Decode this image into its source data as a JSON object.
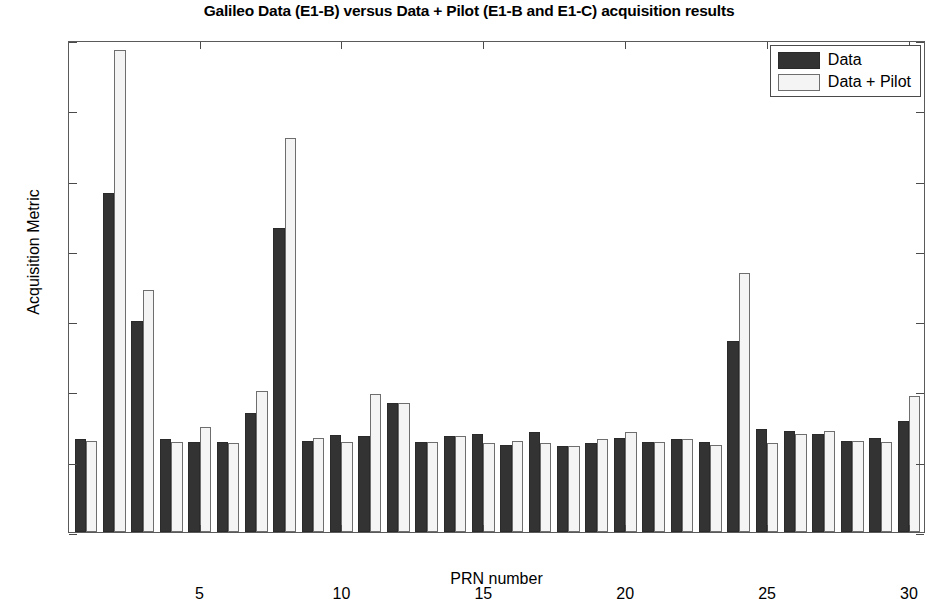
{
  "chart_data": {
    "type": "bar",
    "title": "Galileo Data (E1-B) versus Data + Pilot (E1-B and E1-C) acquisition results",
    "xlabel": "PRN number",
    "ylabel": "Acquisition Metric",
    "ylim": [
      0,
      35
    ],
    "xlim": [
      0.4,
      30.6
    ],
    "ytick_values": [
      0,
      5,
      10,
      15,
      20,
      25,
      30,
      35
    ],
    "ytick_labels": [
      "0",
      "5",
      "10",
      "15",
      "20",
      "25",
      "30",
      "35"
    ],
    "xtick_values": [
      5,
      10,
      15,
      20,
      25,
      30
    ],
    "xtick_labels": [
      "5",
      "10",
      "15",
      "20",
      "25",
      "30"
    ],
    "grid": false,
    "legend_position": "top-right",
    "categories": [
      1,
      2,
      3,
      4,
      5,
      6,
      7,
      8,
      9,
      10,
      11,
      12,
      13,
      14,
      15,
      16,
      17,
      18,
      19,
      20,
      21,
      22,
      23,
      24,
      25,
      26,
      27,
      28,
      29,
      30
    ],
    "series": [
      {
        "name": "Data",
        "color": "#333333",
        "values": [
          6.6,
          24.1,
          15.0,
          6.6,
          6.4,
          6.4,
          8.5,
          21.6,
          6.5,
          6.9,
          6.8,
          9.2,
          6.4,
          6.8,
          7.0,
          6.2,
          7.1,
          6.1,
          6.3,
          6.7,
          6.4,
          6.6,
          6.4,
          13.6,
          7.3,
          7.2,
          7.0,
          6.5,
          6.7,
          7.9
        ]
      },
      {
        "name": "Data + Pilot",
        "color": "#f4f4f4",
        "values": [
          6.5,
          34.3,
          17.2,
          6.4,
          7.5,
          6.3,
          10.0,
          28.0,
          6.7,
          6.4,
          9.8,
          9.2,
          6.4,
          6.8,
          6.3,
          6.5,
          6.3,
          6.1,
          6.6,
          7.1,
          6.4,
          6.6,
          6.2,
          18.4,
          6.3,
          7.0,
          7.2,
          6.5,
          6.4,
          9.7
        ]
      }
    ]
  },
  "legend": {
    "items": [
      {
        "label": "Data",
        "swatch": "data"
      },
      {
        "label": "Data + Pilot",
        "swatch": "pilot"
      }
    ]
  }
}
